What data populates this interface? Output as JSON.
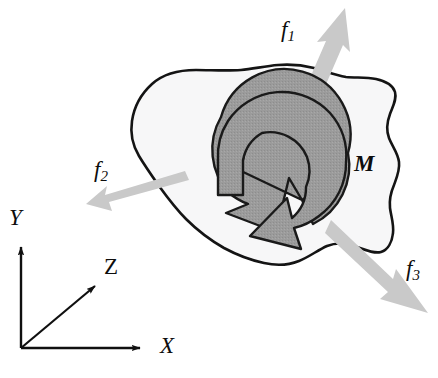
{
  "figure": {
    "background_color": "#ffffff",
    "width": 438,
    "height": 378
  },
  "body_shape": {
    "name": "rigid-body-blob",
    "fill_color": "#f7f7f8",
    "stroke_color": "#141414",
    "stroke_width": 2.6
  },
  "moment_arrow": {
    "name": "curved-moment-arrow",
    "fill_color": "#9b9b9b",
    "stroke_color": "#1a1a1a",
    "direction": "counterclockwise",
    "center_x": 283,
    "center_y": 168
  },
  "force_arrows": {
    "color": "#c9c9c9",
    "items": [
      {
        "id": "f1",
        "label": "f",
        "subscript": "1",
        "tail_x": 303,
        "tail_y": 107,
        "head_x": 345,
        "head_y": 8,
        "direction": "up-right"
      },
      {
        "id": "f2",
        "label": "f",
        "subscript": "2",
        "tail_x": 184,
        "tail_y": 174,
        "head_x": 86,
        "head_y": 204,
        "direction": "down-left"
      },
      {
        "id": "f3",
        "label": "f",
        "subscript": "3",
        "tail_x": 336,
        "tail_y": 225,
        "head_x": 428,
        "head_y": 313,
        "direction": "down-right"
      }
    ]
  },
  "moment_label": {
    "id": "M",
    "label": "M"
  },
  "axes": {
    "origin_x": 21,
    "origin_y": 348,
    "color": "#101010",
    "items": [
      {
        "id": "x-axis",
        "label": "X",
        "tip_x": 146,
        "tip_y": 348,
        "direction": "right"
      },
      {
        "id": "y-axis",
        "label": "Y",
        "tip_x": 21,
        "tip_y": 241,
        "direction": "up"
      },
      {
        "id": "z-axis",
        "label": "Z",
        "tip_x": 100,
        "tip_y": 281,
        "direction": "up-right-diagonal"
      }
    ]
  }
}
